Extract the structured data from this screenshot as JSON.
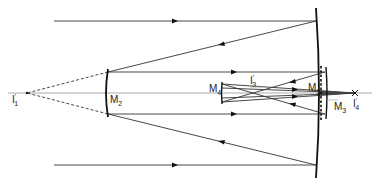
{
  "figure": {
    "type": "optical-ray-diagram",
    "labels": {
      "i1": {
        "main": "I",
        "prime": "'",
        "sub": "1"
      },
      "m2": {
        "main": "M",
        "sub": "2"
      },
      "m4": {
        "main": "M",
        "sub": "4"
      },
      "i3": {
        "main": "I",
        "prime": "'",
        "sub": "3"
      },
      "m1": {
        "main": "M",
        "sub": "1"
      },
      "m3": {
        "main": "M",
        "sub": "3"
      },
      "i4": {
        "main": "I",
        "prime": "'",
        "sub": "4"
      }
    },
    "colors": {
      "line": "#333333",
      "mirror": "#111111",
      "axis": "#888888",
      "background": "#ffffff"
    }
  }
}
